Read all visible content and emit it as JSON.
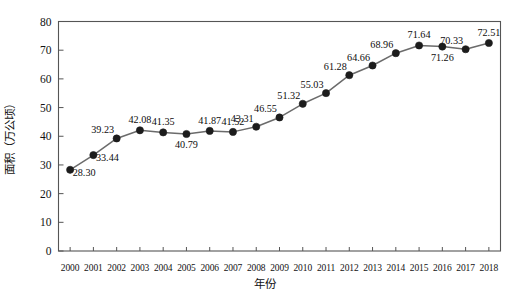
{
  "chart_data": {
    "type": "line",
    "title": "",
    "xlabel": "年份",
    "ylabel": "面积（万公顷）",
    "categories": [
      "2000",
      "2001",
      "2002",
      "2003",
      "2004",
      "2005",
      "2006",
      "2007",
      "2008",
      "2009",
      "2010",
      "2011",
      "2012",
      "2013",
      "2014",
      "2015",
      "2016",
      "2017",
      "2018"
    ],
    "values": [
      28.3,
      33.44,
      39.23,
      42.08,
      41.35,
      40.79,
      41.87,
      41.52,
      43.31,
      46.55,
      51.32,
      55.03,
      61.28,
      64.66,
      68.96,
      71.64,
      71.26,
      70.33,
      72.51
    ],
    "data_labels": [
      "28.30",
      "33.44",
      "39.23",
      "42.08",
      "41.35",
      "40.79",
      "41.87",
      "41.52",
      "43.31",
      "46.55",
      "51.32",
      "55.03",
      "61.28",
      "64.66",
      "68.96",
      "71.64",
      "71.26",
      "70.33",
      "72.51"
    ],
    "label_positions": [
      "right-below",
      "right-below",
      "above-left",
      "above",
      "above",
      "below",
      "above",
      "above",
      "above-left",
      "above-left",
      "above-left",
      "above-left",
      "above-left",
      "above-left",
      "above-left",
      "above",
      "below",
      "above-left",
      "above"
    ],
    "ylim": [
      0,
      80
    ],
    "y_ticks": [
      "0",
      "10",
      "20",
      "30",
      "40",
      "50",
      "60",
      "70",
      "80"
    ],
    "y_tick_values": [
      0,
      10,
      20,
      30,
      40,
      50,
      60,
      70,
      80
    ],
    "grid": false,
    "legend": "none",
    "marker": "filled-circle",
    "line_color": "#6b6b6b",
    "marker_color": "#1c1c1c",
    "axis_color": "#555555",
    "background": "#ffffff"
  },
  "axes": {
    "y_title": "面积（万公顷）",
    "x_title": "年份"
  }
}
